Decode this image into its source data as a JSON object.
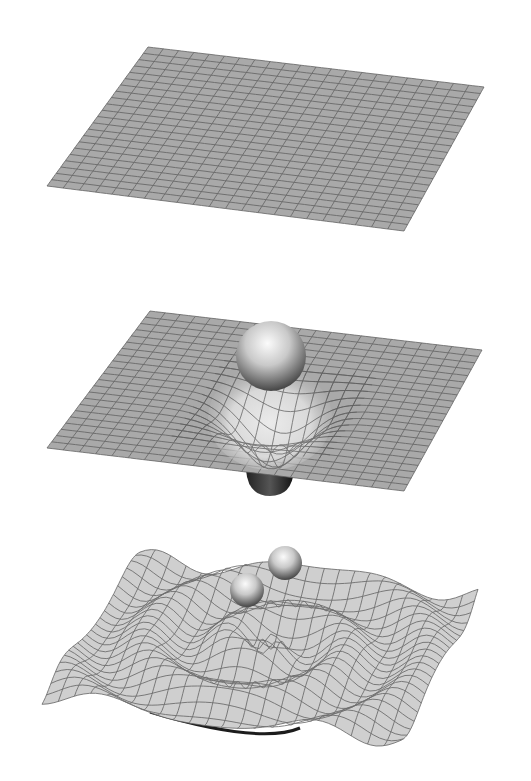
{
  "figure": {
    "background": "#ffffff",
    "colors": {
      "sheet_flat": "#a9a9a9",
      "grid_line": "#5e5e5e",
      "sheet_bright": "#e6e6e6",
      "sphere_light": "#f4f4f4",
      "sphere_dark": "#4a4a4a",
      "shadow": "#1c1c1c"
    },
    "grid_divisions": 22,
    "panels": [
      {
        "id": "flat-spacetime",
        "corners": {
          "tl": [
            148,
            47
          ],
          "tr": [
            484,
            87
          ],
          "br": [
            404,
            231
          ],
          "bl": [
            47,
            186
          ]
        },
        "masses": []
      },
      {
        "id": "curved-spacetime",
        "corners": {
          "tl": [
            150,
            311
          ],
          "tr": [
            482,
            350
          ],
          "br": [
            404,
            491
          ],
          "bl": [
            47,
            448
          ]
        },
        "masses": [
          {
            "cx": 271,
            "cy": 356,
            "r": 35
          }
        ],
        "well": {
          "cx": 268,
          "cy": 420,
          "depth": 60
        }
      },
      {
        "id": "gravitational-waves",
        "corners": {
          "tl": [
            140,
            557
          ],
          "tr": [
            478,
            595
          ],
          "br": [
            400,
            740
          ],
          "bl": [
            42,
            696
          ]
        },
        "masses": [
          {
            "cx": 247,
            "cy": 590,
            "r": 17
          },
          {
            "cx": 285,
            "cy": 563,
            "r": 17
          }
        ]
      }
    ]
  }
}
